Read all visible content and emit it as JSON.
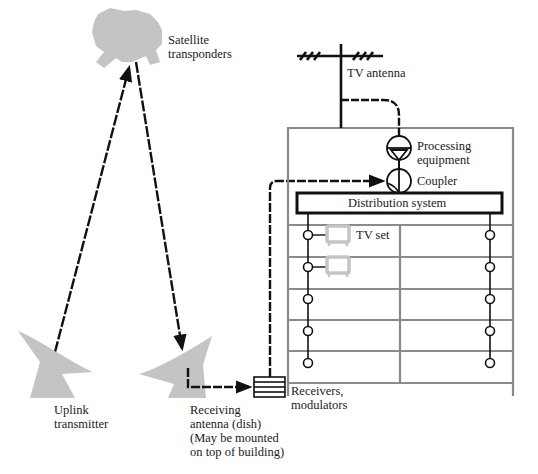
{
  "diagram": {
    "type": "cable-tv-satellite-distribution",
    "colors": {
      "line": "#111111",
      "equipment_gray": "#bdbdbd",
      "building_outline": "#8a8a8a",
      "background": "#ffffff"
    },
    "labels": {
      "satellite": "Satellite\ntransponders",
      "tv_antenna": "TV antenna",
      "processing": "Processing\nequipment",
      "coupler": "Coupler",
      "distribution": "Distribution system",
      "tv_set": "TV set",
      "uplink": "Uplink\ntransmitter",
      "receiving": "Receiving\nantenna (dish)\n(May be mounted\non top of building)",
      "receivers": "Receivers,\nmodulators"
    },
    "nodes": [
      {
        "id": "satellite",
        "label": "Satellite transponders"
      },
      {
        "id": "uplink",
        "label": "Uplink transmitter"
      },
      {
        "id": "receiving-dish",
        "label": "Receiving antenna (dish)"
      },
      {
        "id": "receivers",
        "label": "Receivers, modulators"
      },
      {
        "id": "tv-antenna",
        "label": "TV antenna"
      },
      {
        "id": "processing",
        "label": "Processing equipment"
      },
      {
        "id": "coupler",
        "label": "Coupler"
      },
      {
        "id": "distribution",
        "label": "Distribution system"
      },
      {
        "id": "tv-set",
        "label": "TV set"
      }
    ],
    "edges": [
      {
        "from": "uplink",
        "to": "satellite",
        "style": "dashed-arrow"
      },
      {
        "from": "satellite",
        "to": "receiving-dish",
        "style": "dashed-arrow"
      },
      {
        "from": "receiving-dish",
        "to": "receivers",
        "style": "dashed-arrow"
      },
      {
        "from": "receivers",
        "to": "coupler",
        "style": "dashed-arrow"
      },
      {
        "from": "tv-antenna",
        "to": "processing",
        "style": "dashed"
      },
      {
        "from": "processing",
        "to": "coupler",
        "style": "solid"
      },
      {
        "from": "coupler",
        "to": "distribution",
        "style": "solid"
      }
    ],
    "building": {
      "floors": 5,
      "outlets_per_riser": 5,
      "risers": 2,
      "tv_sets_shown": 2
    }
  }
}
